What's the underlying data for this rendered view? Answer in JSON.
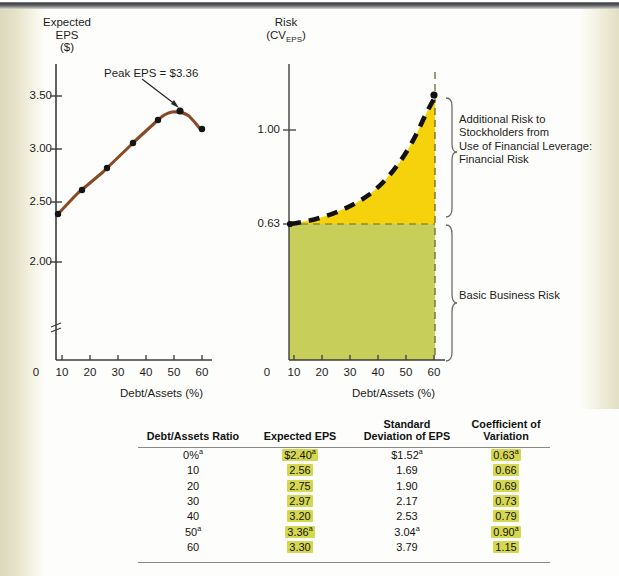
{
  "left_chart": {
    "y_axis_title": "Expected\nEPS\n($)",
    "x_axis_title": "Debt/Assets (%)",
    "y_ticks": [
      "3.50",
      "3.00",
      "2.50",
      "2.00"
    ],
    "x_ticks": [
      "0",
      "10",
      "20",
      "30",
      "40",
      "50",
      "60"
    ],
    "annotation": "Peak EPS = $3.36",
    "line_color": "#8a4a26",
    "marker_color": "#1a1a1a"
  },
  "right_chart": {
    "y_axis_title_line1": "Risk",
    "y_axis_title_line2_prefix": "(CV",
    "y_axis_title_line2_sub": "EPS",
    "y_axis_title_line2_suffix": ")",
    "x_axis_title": "Debt/Assets (%)",
    "y_ticks": [
      "1.00",
      "0.63"
    ],
    "x_ticks": [
      "0",
      "10",
      "20",
      "30",
      "40",
      "50",
      "60"
    ],
    "financial_risk_label": "Additional Risk to\nStockholders from\nUse of Financial Leverage:\nFinancial Risk",
    "business_risk_label": "Basic Business Risk",
    "financial_risk_color": "#f5d20c",
    "business_risk_color": "#c8ce5a",
    "curve_color": "#111111"
  },
  "table": {
    "headers": [
      "Debt/Assets Ratio",
      "Expected EPS",
      "Standard\nDeviation of EPS",
      "Coefficient of\nVariation"
    ],
    "header_lines": {
      "c0": [
        "Debt/Assets Ratio"
      ],
      "c1": [
        "Expected EPS"
      ],
      "c2": [
        "Standard",
        "Deviation of EPS"
      ],
      "c3": [
        "Coefficient of",
        "Variation"
      ]
    },
    "highlight_color": "#d5d84f",
    "rows": [
      {
        "debt_assets": "0%",
        "debt_assets_note": "a",
        "eps": "$2.40",
        "eps_note": "a",
        "sd": "$1.52",
        "sd_note": "a",
        "cv": "0.63",
        "cv_note": "a"
      },
      {
        "debt_assets": "10",
        "debt_assets_note": "",
        "eps": "2.56",
        "eps_note": "",
        "sd": "1.69",
        "sd_note": "",
        "cv": "0.66",
        "cv_note": ""
      },
      {
        "debt_assets": "20",
        "debt_assets_note": "",
        "eps": "2.75",
        "eps_note": "",
        "sd": "1.90",
        "sd_note": "",
        "cv": "0.69",
        "cv_note": ""
      },
      {
        "debt_assets": "30",
        "debt_assets_note": "",
        "eps": "2.97",
        "eps_note": "",
        "sd": "2.17",
        "sd_note": "",
        "cv": "0.73",
        "cv_note": ""
      },
      {
        "debt_assets": "40",
        "debt_assets_note": "",
        "eps": "3.20",
        "eps_note": "",
        "sd": "2.53",
        "sd_note": "",
        "cv": "0.79",
        "cv_note": ""
      },
      {
        "debt_assets": "50",
        "debt_assets_note": "a",
        "eps": "3.36",
        "eps_note": "a",
        "sd": "3.04",
        "sd_note": "a",
        "cv": "0.90",
        "cv_note": "a"
      },
      {
        "debt_assets": "60",
        "debt_assets_note": "",
        "eps": "3.30",
        "eps_note": "",
        "sd": "3.79",
        "sd_note": "",
        "cv": "1.15",
        "cv_note": ""
      }
    ]
  },
  "chart_data": [
    {
      "type": "line",
      "title": "Expected EPS",
      "xlabel": "Debt/Assets (%)",
      "ylabel": "Expected EPS ($)",
      "x": [
        0,
        10,
        20,
        30,
        40,
        50,
        60
      ],
      "values": [
        2.4,
        2.56,
        2.75,
        2.97,
        3.2,
        3.36,
        3.3
      ],
      "xlim": [
        0,
        60
      ],
      "ylim": [
        1.75,
        3.7
      ],
      "y_ticks": [
        2.0,
        2.5,
        3.0,
        3.5
      ],
      "x_ticks": [
        0,
        10,
        20,
        30,
        40,
        50,
        60
      ],
      "grid": false,
      "legend": "none",
      "annotations": [
        "Peak EPS = $3.36"
      ],
      "axis_break_y": true
    },
    {
      "type": "area",
      "title": "Risk (CV of EPS)",
      "xlabel": "Debt/Assets (%)",
      "ylabel": "Risk (CV EPS)",
      "x": [
        0,
        10,
        20,
        30,
        40,
        50,
        60
      ],
      "values": [
        0.63,
        0.66,
        0.69,
        0.73,
        0.79,
        0.9,
        1.15
      ],
      "baseline": 0.63,
      "xlim": [
        0,
        60
      ],
      "ylim": [
        0,
        1.22
      ],
      "y_ticks": [
        0.63,
        1.0
      ],
      "x_ticks": [
        0,
        10,
        20,
        30,
        40,
        50,
        60
      ],
      "grid": false,
      "legend": "none",
      "series": [
        {
          "name": "Basic Business Risk",
          "region": "0 to 0.63",
          "color": "#c8ce5a"
        },
        {
          "name": "Additional Risk to Stockholders from Use of Financial Leverage: Financial Risk",
          "region": "0.63 to CV curve",
          "color": "#f5d20c"
        }
      ]
    }
  ]
}
